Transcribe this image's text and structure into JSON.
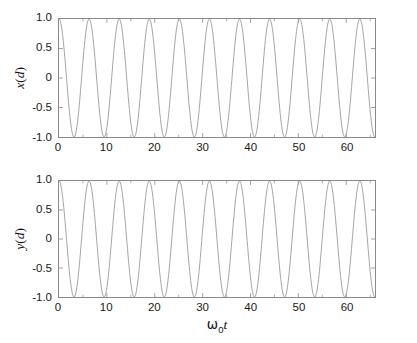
{
  "figure": {
    "background": "#ffffff",
    "line_color": "#9a9a9a",
    "axis_color": "#8a8a8a",
    "text_color": "#111111"
  },
  "xlabel": {
    "omega": "ω",
    "subscript": "0",
    "t": "t",
    "full": "ω₀t"
  },
  "chart_data": [
    {
      "type": "line",
      "title": "",
      "xlabel": "ω₀t",
      "ylabel": "x ( d )",
      "ylabel_parts": {
        "variable": "x",
        "open": "(",
        "arg": "d",
        "close": ")"
      },
      "xlim": [
        0,
        66
      ],
      "ylim": [
        -1.0,
        1.0
      ],
      "grid": false,
      "legend": null,
      "xticks": [
        0,
        10,
        20,
        30,
        40,
        50,
        60
      ],
      "xtick_labels": [
        "0",
        "10",
        "20",
        "30",
        "40",
        "50",
        "60"
      ],
      "xticks_minor": [
        5,
        15,
        25,
        35,
        45,
        55,
        65
      ],
      "yticks": [
        -1.0,
        -0.5,
        0,
        0.5,
        1.0
      ],
      "ytick_labels": [
        "-1.0",
        "-0.5",
        "0",
        "0.5",
        "1.0"
      ],
      "series": [
        {
          "name": "x",
          "function": "cos",
          "amplitude": 1.0,
          "angular_frequency": 1.0,
          "phase": 0.0,
          "period": 6.2832,
          "num_cycles": 10.5,
          "samples": 661
        }
      ]
    },
    {
      "type": "line",
      "title": "",
      "xlabel": "ω₀t",
      "ylabel": "y ( d )",
      "ylabel_parts": {
        "variable": "y",
        "open": "(",
        "arg": "d",
        "close": ")"
      },
      "xlim": [
        0,
        66
      ],
      "ylim": [
        -1.0,
        1.0
      ],
      "grid": false,
      "legend": null,
      "xticks": [
        0,
        10,
        20,
        30,
        40,
        50,
        60
      ],
      "xtick_labels": [
        "0",
        "10",
        "20",
        "30",
        "40",
        "50",
        "60"
      ],
      "xticks_minor": [
        5,
        15,
        25,
        35,
        45,
        55,
        65
      ],
      "yticks": [
        -1.0,
        -0.5,
        0,
        0.5,
        1.0
      ],
      "ytick_labels": [
        "-1.0",
        "-0.5",
        "0",
        "0.5",
        "1.0"
      ],
      "series": [
        {
          "name": "y",
          "function": "cos",
          "amplitude": 1.0,
          "angular_frequency": 1.0,
          "phase": 0.0,
          "period": 6.2832,
          "num_cycles": 10.5,
          "samples": 661
        }
      ]
    }
  ]
}
